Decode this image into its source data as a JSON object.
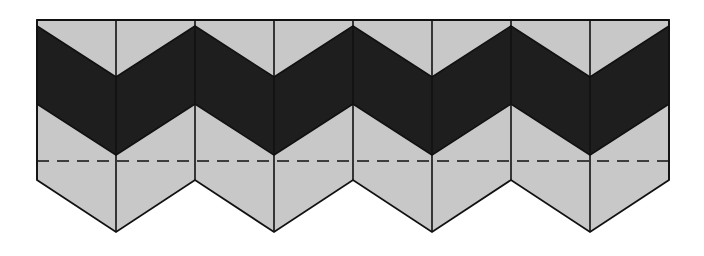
{
  "diagram": {
    "colors": {
      "light": "#c8c8c8",
      "dark": "#1e1e1e",
      "outline": "#111111",
      "background": "#ffffff"
    },
    "geometry": {
      "left": 37,
      "top": 20,
      "column_width": 79,
      "columns": 8,
      "dark_band_top_edge_y": 26,
      "dark_band_top_dip_y": 77,
      "dark_band_bottom_edge_y": 104,
      "dark_band_bottom_dip_y": 155,
      "outline_bottom_edge_y": 180,
      "outline_bottom_dip_y": 232,
      "dashed_line_y": 161
    },
    "elements": {
      "chevron_count": 4,
      "dashed_line": "fold/seam line"
    }
  }
}
